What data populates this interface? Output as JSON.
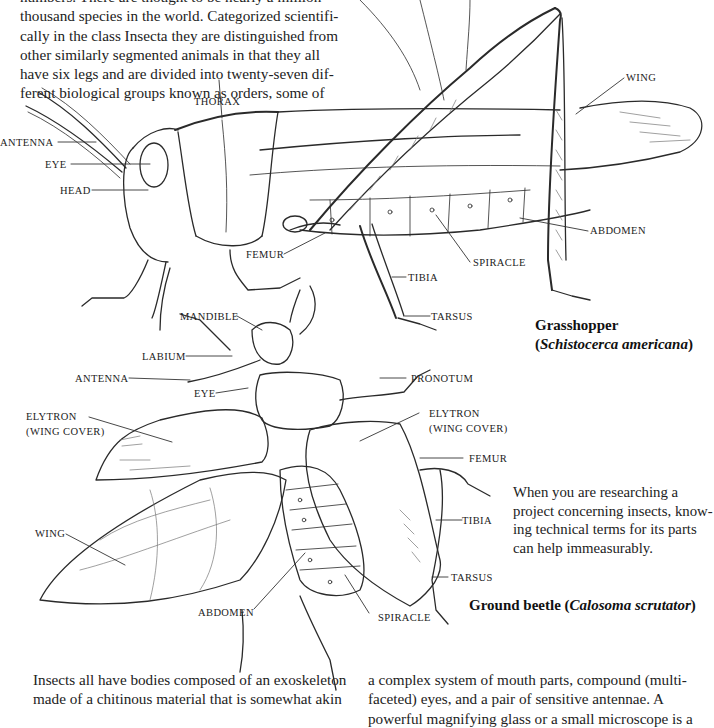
{
  "intro_paragraph": {
    "lines": [
      "numbers. There are thought to be nearly a million",
      "thousand species in the world. Categorized scientifi-",
      "cally in the class Insecta they are distinguished from",
      "other similarly segmented animals in that they all",
      "have six legs and are divided into twenty-seven dif-",
      "ferent biological groups known as orders, some of"
    ]
  },
  "grasshopper": {
    "labels": {
      "thorax": "THORAX",
      "antenna": "ANTENNA",
      "eye": "EYE",
      "head": "HEAD",
      "wing": "WING",
      "femur": "FEMUR",
      "tibia": "TIBIA",
      "tarsus": "TARSUS",
      "spiracle": "SPIRACLE",
      "abdomen": "ABDOMEN"
    },
    "caption": {
      "common_name": "Grasshopper",
      "open_paren": "(",
      "scientific_name": "Schistocerca americana",
      "close_paren": ")"
    }
  },
  "beetle": {
    "labels": {
      "mandible": "MANDIBLE",
      "labium": "LABIUM",
      "antenna": "ANTENNA",
      "eye": "EYE",
      "pronotum": "PRONOTUM",
      "elytron_left_1": "ELYTRON",
      "elytron_left_2": "(WING COVER)",
      "elytron_right_1": "ELYTRON",
      "elytron_right_2": "(WING COVER)",
      "femur": "FEMUR",
      "tibia": "TIBIA",
      "tarsus": "TARSUS",
      "wing": "WING",
      "abdomen": "ABDOMEN",
      "spiracle": "SPIRACLE"
    },
    "caption": {
      "common_name": "Ground beetle",
      "open_paren": " (",
      "scientific_name": "Calosoma scrutator",
      "close_paren": ")"
    }
  },
  "side_note": {
    "lines": [
      "When you are researching a",
      "project concerning insects, know-",
      "ing technical terms for its parts",
      "can help immeasurably."
    ]
  },
  "bottom_left_paragraph": {
    "lines": [
      "Insects all have bodies composed of an exoskeleton",
      "made of a chitinous material that is somewhat akin"
    ]
  },
  "bottom_right_paragraph": {
    "lines": [
      "a complex system of mouth parts, compound (multi-",
      "faceted) eyes, and a pair of sensitive antennae. A",
      "powerful magnifying glass or a small microscope is a"
    ]
  }
}
